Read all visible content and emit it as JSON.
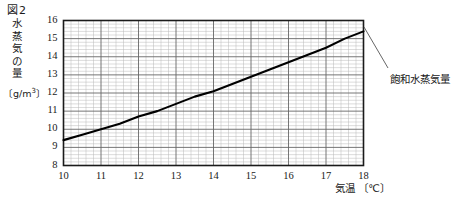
{
  "figure": {
    "title": "図2",
    "annotation": "飽和水蒸気量",
    "y_axis_title_chars": [
      "水",
      "蒸",
      "気",
      "の",
      "量"
    ],
    "y_axis_unit": "〔g/m",
    "y_axis_unit_sup": "3",
    "y_axis_unit_tail": "〕",
    "x_axis_title": "気温 〔℃〕"
  },
  "chart_data": {
    "type": "line",
    "title": "図2",
    "xlabel": "気温 〔℃〕",
    "ylabel": "水蒸気の量 〔g/m3〕",
    "xlim": [
      10,
      18
    ],
    "ylim": [
      8,
      16
    ],
    "xticks": [
      10,
      11,
      12,
      13,
      14,
      15,
      16,
      17,
      18
    ],
    "xticklabels": [
      "10",
      "11",
      "12",
      "13",
      "14",
      "15",
      "16",
      "17",
      "18"
    ],
    "yticks": [
      8,
      9,
      10,
      11,
      12,
      13,
      14,
      15,
      16
    ],
    "yticklabels": [
      "8",
      "9",
      "10",
      "11",
      "12",
      "13",
      "14",
      "15",
      "16"
    ],
    "grid": true,
    "grid_major_x_step": 1,
    "grid_major_y_step": 1,
    "grid_minor_x_step": 0.2,
    "grid_minor_y_step": 0.2,
    "legend": "none",
    "annotations": [
      {
        "text": "飽和水蒸気量",
        "points_to_x": 18,
        "points_to_y": 15.4
      }
    ],
    "series": [
      {
        "name": "飽和水蒸気量",
        "color": "#000000",
        "x": [
          10,
          10.5,
          11,
          11.5,
          12,
          12.5,
          13,
          13.5,
          14,
          14.5,
          15,
          15.5,
          16,
          16.5,
          17,
          17.5,
          18
        ],
        "values": [
          9.4,
          9.7,
          10.0,
          10.3,
          10.7,
          11.0,
          11.4,
          11.8,
          12.1,
          12.5,
          12.9,
          13.3,
          13.7,
          14.1,
          14.5,
          15.0,
          15.4
        ]
      }
    ]
  }
}
